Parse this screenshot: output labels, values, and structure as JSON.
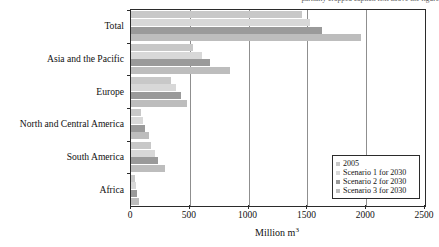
{
  "top_caption": "partially cropped caption text above the figure",
  "chart_data": {
    "type": "bar",
    "orientation": "horizontal",
    "title": "",
    "xlabel": "Million m3",
    "xlabel_html": "Million m",
    "xlabel_superscript": "3",
    "ylabel": "",
    "xlim": [
      0,
      2500
    ],
    "xticks": [
      0,
      500,
      1000,
      1500,
      2000,
      2500
    ],
    "xtick_labels": [
      "0",
      "500",
      "1000",
      "1500",
      "2000",
      "2500"
    ],
    "grid": "vertical",
    "legend_position": "bottom-right",
    "categories": [
      "Total",
      "Asia and the Pacific",
      "Europe",
      "North and Central America",
      "South America",
      "Africa"
    ],
    "series": [
      {
        "name": "2005",
        "color": "#c8c8c8",
        "values": [
          1450,
          530,
          340,
          85,
          170,
          30
        ]
      },
      {
        "name": "Scenario 1 for 2030",
        "color": "#d8d8d8",
        "values": [
          1520,
          600,
          380,
          105,
          205,
          45
        ]
      },
      {
        "name": "Scenario 2 for 2030",
        "color": "#9a9a9a",
        "values": [
          1620,
          670,
          425,
          120,
          230,
          55
        ]
      },
      {
        "name": "Scenario 3 for 2030",
        "color": "#bdbdbd",
        "values": [
          1960,
          845,
          480,
          150,
          290,
          65
        ]
      }
    ]
  },
  "legend": {
    "items": [
      {
        "label": "2005",
        "color": "#c8c8c8"
      },
      {
        "label": "Scenario 1 for 2030",
        "color": "#d8d8d8"
      },
      {
        "label": "Scenario 2 for 2030",
        "color": "#9a9a9a"
      },
      {
        "label": "Scenario 3 for 2030",
        "color": "#bdbdbd"
      }
    ]
  }
}
